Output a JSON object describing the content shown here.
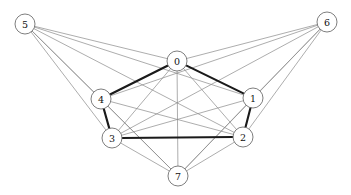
{
  "figure": {
    "kind": "undirected-graph-drawing",
    "width": 351,
    "height": 195,
    "background_color": "#ffffff"
  },
  "style": {
    "thin_edge_color": "#8a8a8a",
    "thin_edge_width": 0.7,
    "bold_edge_color": "#1a1a1a",
    "bold_edge_width": 2.1,
    "node_fill": "#ffffff",
    "node_stroke": "#6f6f6f",
    "node_stroke_width": 0.9,
    "node_radius": 10,
    "label_color": "#111111",
    "label_font_size": 9.5
  },
  "graph": {
    "node_count": 8,
    "edge_count": 20,
    "nodes": [
      {
        "id": "0",
        "label": "0",
        "x": 177,
        "y": 61,
        "r": 10
      },
      {
        "id": "1",
        "label": "1",
        "x": 253,
        "y": 98,
        "r": 10
      },
      {
        "id": "2",
        "label": "2",
        "x": 243,
        "y": 137,
        "r": 10
      },
      {
        "id": "3",
        "label": "3",
        "x": 112,
        "y": 138,
        "r": 10
      },
      {
        "id": "4",
        "label": "4",
        "x": 101,
        "y": 99,
        "r": 10
      },
      {
        "id": "5",
        "label": "5",
        "x": 25,
        "y": 24,
        "r": 10
      },
      {
        "id": "6",
        "label": "6",
        "x": 327,
        "y": 22,
        "r": 10
      },
      {
        "id": "7",
        "label": "7",
        "x": 178,
        "y": 176,
        "r": 10
      }
    ],
    "edges": [
      {
        "source": "0",
        "target": "4",
        "weight": "bold"
      },
      {
        "source": "0",
        "target": "1",
        "weight": "bold"
      },
      {
        "source": "1",
        "target": "2",
        "weight": "bold"
      },
      {
        "source": "2",
        "target": "3",
        "weight": "bold"
      },
      {
        "source": "3",
        "target": "4",
        "weight": "bold"
      },
      {
        "source": "0",
        "target": "7",
        "weight": "thin"
      },
      {
        "source": "0",
        "target": "2",
        "weight": "thin"
      },
      {
        "source": "0",
        "target": "3",
        "weight": "thin"
      },
      {
        "source": "4",
        "target": "2",
        "weight": "thin"
      },
      {
        "source": "4",
        "target": "7",
        "weight": "thin"
      },
      {
        "source": "3",
        "target": "1",
        "weight": "thin"
      },
      {
        "source": "3",
        "target": "7",
        "weight": "thin"
      },
      {
        "source": "1",
        "target": "7",
        "weight": "thin"
      },
      {
        "source": "2",
        "target": "7",
        "weight": "thin"
      },
      {
        "source": "5",
        "target": "0",
        "weight": "thin"
      },
      {
        "source": "5",
        "target": "1",
        "weight": "thin"
      },
      {
        "source": "5",
        "target": "2",
        "weight": "thin"
      },
      {
        "source": "5",
        "target": "4",
        "weight": "thin"
      },
      {
        "source": "5",
        "target": "3",
        "weight": "thin"
      },
      {
        "source": "6",
        "target": "0",
        "weight": "thin"
      },
      {
        "source": "6",
        "target": "1",
        "weight": "thin"
      },
      {
        "source": "6",
        "target": "2",
        "weight": "thin"
      },
      {
        "source": "6",
        "target": "4",
        "weight": "thin"
      },
      {
        "source": "6",
        "target": "3",
        "weight": "thin"
      },
      {
        "source": "6",
        "target": "7",
        "weight": "thin"
      },
      {
        "source": "5",
        "target": "7",
        "weight": "thin"
      }
    ]
  }
}
